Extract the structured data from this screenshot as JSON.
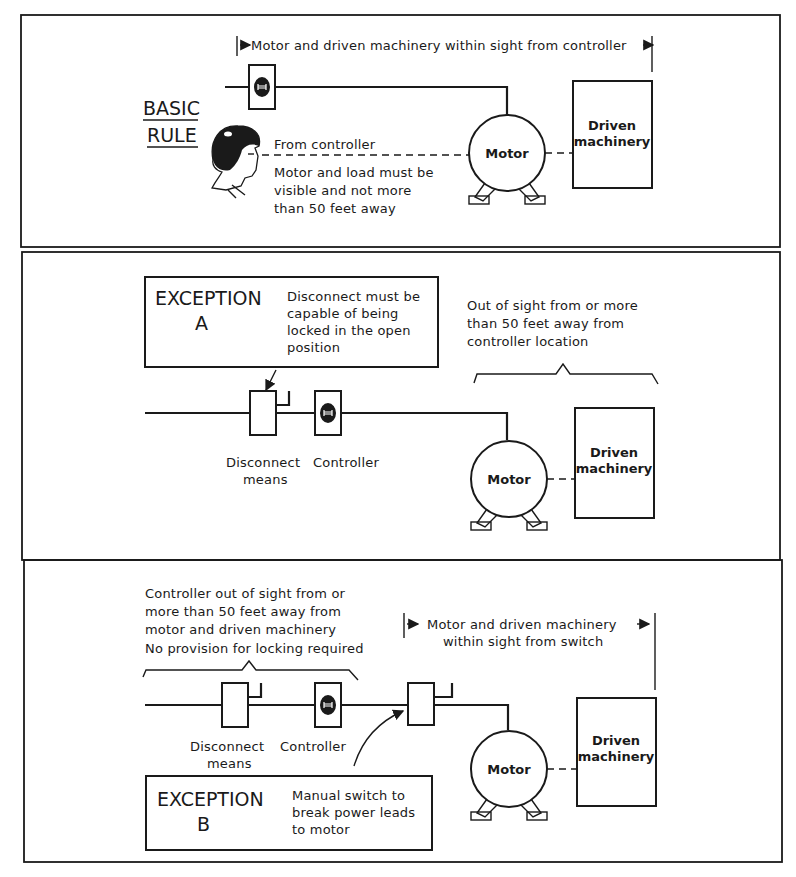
{
  "figure": {
    "panels": [
      {
        "id": "basic-rule",
        "title_line1": "BASIC",
        "title_line2": "RULE",
        "span_label": "Motor and driven machinery within sight from controller",
        "sight_label": "From controller",
        "note_lines": [
          "Motor and load must be",
          "visible and not more",
          "than 50 feet away"
        ],
        "motor_label": "Motor",
        "machinery_line1": "Driven",
        "machinery_line2": "machinery"
      },
      {
        "id": "exception-a",
        "title_line1": "EXCEPTION",
        "title_line2": "A",
        "box_text_lines": [
          "Disconnect must be",
          "capable of being",
          "locked in the open",
          "position"
        ],
        "brace_label_lines": [
          "Out of sight from or more",
          "than 50 feet away from",
          "controller location"
        ],
        "disconnect_label_line1": "Disconnect",
        "disconnect_label_line2": "means",
        "controller_label": "Controller",
        "motor_label": "Motor",
        "machinery_line1": "Driven",
        "machinery_line2": "machinery"
      },
      {
        "id": "exception-b",
        "title_line1": "EXCEPTION",
        "title_line2": "B",
        "box_text_lines": [
          "Manual switch to",
          "break power leads",
          "to motor"
        ],
        "brace_label_lines": [
          "Controller out of sight from or",
          "more than 50 feet away from",
          "motor and driven machinery",
          "No provision for locking required"
        ],
        "span_label_line1": "Motor and driven machinery",
        "span_label_line2": "within sight from switch",
        "disconnect_label_line1": "Disconnect",
        "disconnect_label_line2": "means",
        "controller_label": "Controller",
        "motor_label": "Motor",
        "machinery_line1": "Driven",
        "machinery_line2": "machinery"
      }
    ]
  }
}
